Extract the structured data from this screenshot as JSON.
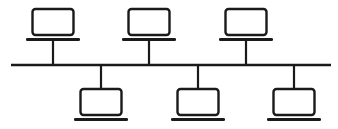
{
  "diagram": {
    "type": "bus-network-topology",
    "stroke_color": "#1a1a1a",
    "background": "#ffffff",
    "bus": {
      "x1": 11,
      "x2": 331,
      "y": 65
    },
    "nodes": [
      {
        "name": "laptop-top-1",
        "position": "top",
        "cx": 53
      },
      {
        "name": "laptop-top-2",
        "position": "top",
        "cx": 149
      },
      {
        "name": "laptop-top-3",
        "position": "top",
        "cx": 246
      },
      {
        "name": "laptop-bottom-1",
        "position": "bottom",
        "cx": 101
      },
      {
        "name": "laptop-bottom-2",
        "position": "bottom",
        "cx": 198
      },
      {
        "name": "laptop-bottom-3",
        "position": "bottom",
        "cx": 294
      }
    ]
  }
}
